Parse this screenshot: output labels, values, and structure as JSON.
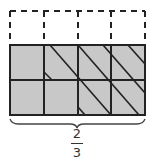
{
  "diagram": {
    "columns": 4,
    "rows_total": 3,
    "rows_shaded": 2,
    "colors": {
      "shade": "#c8c8c8",
      "line": "#222222",
      "dash": "#222222"
    },
    "label": {
      "numerator": "2",
      "denominator": "3"
    }
  }
}
